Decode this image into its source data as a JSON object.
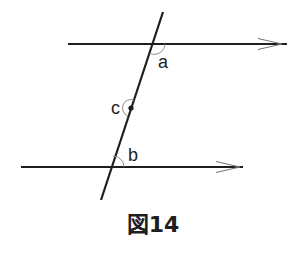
{
  "figure": {
    "caption": "図14",
    "colors": {
      "line": "#1e1e1e",
      "arrow": "#7a7a7a",
      "arc": "#8a8a8a",
      "background": "#ffffff"
    },
    "lines": {
      "top_parallel": {
        "x1": 68,
        "y1": 44,
        "x2": 287,
        "y2": 44,
        "arrow_at": 282
      },
      "bottom_parallel": {
        "x1": 21,
        "y1": 167,
        "x2": 243,
        "y2": 167,
        "arrow_at": 240
      },
      "transversal": {
        "x1": 163,
        "y1": 12,
        "x2": 101,
        "y2": 200
      }
    },
    "angles": [
      {
        "name": "a",
        "label": "a"
      },
      {
        "name": "b",
        "label": "b"
      },
      {
        "name": "c",
        "label": "c"
      }
    ]
  }
}
